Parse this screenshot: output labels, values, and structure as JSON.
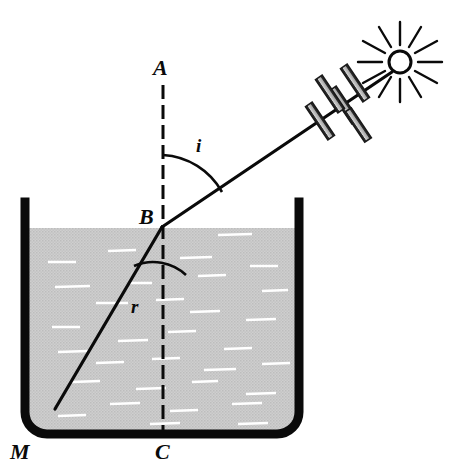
{
  "figure": {
    "background_color": "#ffffff",
    "ink_color": "#0a0a0a",
    "water_color": "#c9c9c9",
    "water_highlight_color": "#ffffff",
    "ray_bar_fill": "#b4b4b4",
    "width": 463,
    "height": 471
  },
  "labels": {
    "normal_top": "A",
    "incidence_point": "B",
    "normal_bottom": "C",
    "vessel": "M",
    "angle_of_incidence": "i",
    "angle_of_refraction": "r"
  },
  "geometry": {
    "incidence_point": {
      "x": 162,
      "y": 227
    },
    "normal_line": {
      "x": 163,
      "y_top": 85,
      "y_bottom": 432,
      "dash": "14 6"
    },
    "incident_ray": {
      "x1": 162,
      "y1": 227,
      "x2": 388,
      "y2": 74
    },
    "refracted_ray": {
      "x1": 162,
      "y1": 227,
      "x2": 55,
      "y2": 409
    },
    "water_surface_y": 228,
    "vessel": {
      "left_x": 21,
      "right_x": 303,
      "top_y": 202,
      "bottom_y": 438,
      "wall_thickness": 8,
      "corner_radius": 22
    },
    "sun": {
      "cx": 400,
      "cy": 62,
      "r": 11,
      "ray_count": 12
    },
    "angle_i_arc_radius": 72,
    "angle_r_arc_radius": 48,
    "ray_hatch_bars": 5
  },
  "icons": {
    "sun": "sun-icon",
    "light-ray": "light-ray-icon",
    "water": "water-icon",
    "vessel": "vessel-icon",
    "normal": "normal-line-icon"
  }
}
